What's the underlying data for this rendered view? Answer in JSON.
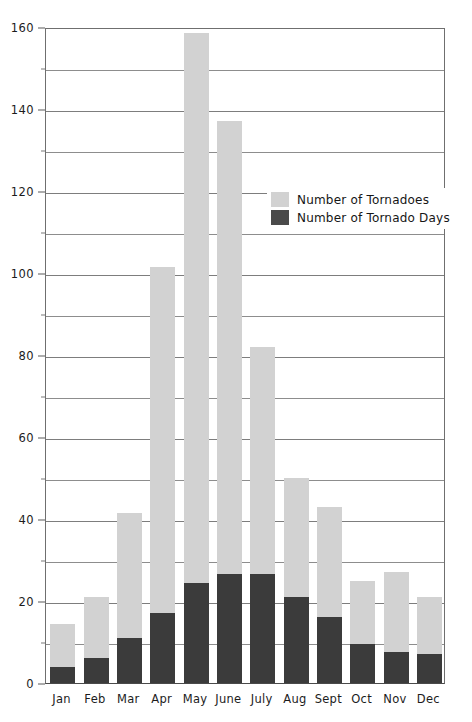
{
  "chart_data": {
    "type": "bar",
    "stacked": true,
    "title": "",
    "subtitle": "",
    "xlabel": "",
    "ylabel": "",
    "ylim": [
      0,
      160
    ],
    "xlim_categories": 12,
    "grid": true,
    "grid_major_step": 20,
    "grid_minor_step": 10,
    "legend_position": "inside-upper-right",
    "categories": [
      "Jan",
      "Feb",
      "Mar",
      "Apr",
      "May",
      "June",
      "July",
      "Aug",
      "Sept",
      "Oct",
      "Nov",
      "Dec"
    ],
    "y_tick_labels": [
      "0",
      "20",
      "40",
      "60",
      "80",
      "100",
      "120",
      "140",
      "160"
    ],
    "y_tick_values": [
      0,
      20,
      40,
      60,
      80,
      100,
      120,
      140,
      160
    ],
    "y_minor_tick_values": [
      10,
      30,
      50,
      70,
      90,
      110,
      130,
      150
    ],
    "series": [
      {
        "name": "Number of Tornadoes",
        "color": "#d2d2d2",
        "values": [
          14.5,
          21,
          41.5,
          101.5,
          158.5,
          137,
          82,
          50,
          43,
          25,
          27,
          21
        ]
      },
      {
        "name": "Number of Tornado Days",
        "color": "#3b3b3b",
        "values": [
          4,
          6,
          11,
          17,
          24.5,
          26.5,
          26.5,
          21,
          16,
          9.5,
          7.5,
          7
        ]
      }
    ]
  },
  "legend": {
    "entries": [
      {
        "label": "Number of Tornadoes",
        "color": "#d2d2d2"
      },
      {
        "label": "Number of Tornado Days",
        "color": "#4a4a4a"
      }
    ]
  },
  "colors": {
    "bar_light": "#d2d2d2",
    "bar_dark": "#3b3b3b",
    "axis": "#5a5a5a",
    "gridline": "#7d7d7d",
    "background": "#ffffff",
    "text": "#1c1c1c"
  }
}
